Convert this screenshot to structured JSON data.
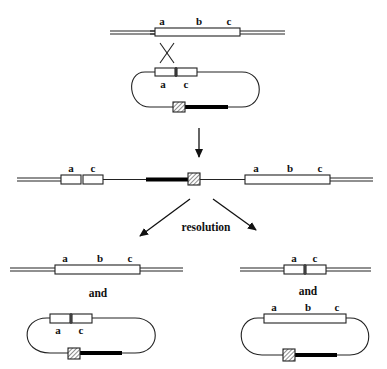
{
  "figure": {
    "top_chromosome": {
      "labels": [
        "a",
        "b",
        "c"
      ]
    },
    "top_plasmid": {
      "labels": [
        "a",
        "c"
      ]
    },
    "integrate": {
      "left_labels": [
        "a",
        "c"
      ],
      "right_labels": [
        "a",
        "b",
        "c"
      ]
    },
    "resolution_label": "resolution",
    "left_product": {
      "chromosome_labels": [
        "a",
        "b",
        "c"
      ],
      "and_label": "and",
      "plasmid_labels": [
        "a",
        "c"
      ]
    },
    "right_product": {
      "chromosome_labels": [
        "a",
        "c"
      ],
      "and_label": "and",
      "plasmid_labels": [
        "a",
        "b",
        "c"
      ]
    }
  }
}
